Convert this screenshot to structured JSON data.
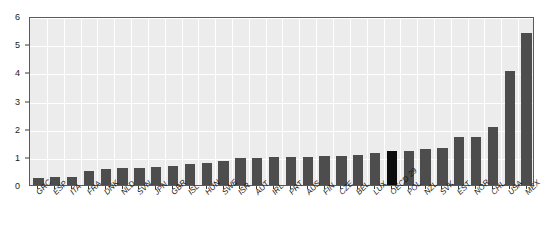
{
  "chart_data": {
    "type": "bar",
    "title": "",
    "subtitle": "",
    "xlabel": "",
    "ylabel": "",
    "ylim": [
      0,
      6
    ],
    "yticks": [
      0,
      1,
      2,
      3,
      4,
      5,
      6
    ],
    "ytick_labels": [
      "0",
      "1",
      "2",
      "3",
      "4",
      "5",
      "6"
    ],
    "grid": true,
    "legend": "none",
    "bar_color": "#4d4d4d",
    "highlight_color": "#0d0d0d",
    "plot_background": "#ececec",
    "gridline_color": "#ffffff",
    "axis_color": "#5a5a5a",
    "highlight_category": "OECD 29",
    "categories": [
      "GRC",
      "ESP",
      "ITA",
      "FRA",
      "DNK",
      "NLD",
      "SVN",
      "JPN",
      "GBR",
      "ISL",
      "HUN",
      "SWE",
      "ISR",
      "AUT",
      "IRL",
      "PRT",
      "AUS",
      "FIN",
      "CZE",
      "BEL",
      "LUX",
      "OECD 29",
      "POL",
      "NZL",
      "SVK",
      "EST",
      "NOR",
      "CHL",
      "USA",
      "MEX"
    ],
    "values": [
      0.26,
      0.27,
      0.28,
      0.49,
      0.58,
      0.6,
      0.61,
      0.63,
      0.67,
      0.76,
      0.77,
      0.84,
      0.95,
      0.96,
      0.99,
      1.0,
      1.01,
      1.03,
      1.04,
      1.06,
      1.12,
      1.19,
      1.2,
      1.27,
      1.33,
      1.69,
      1.7,
      2.05,
      4.05,
      5.38
    ]
  }
}
